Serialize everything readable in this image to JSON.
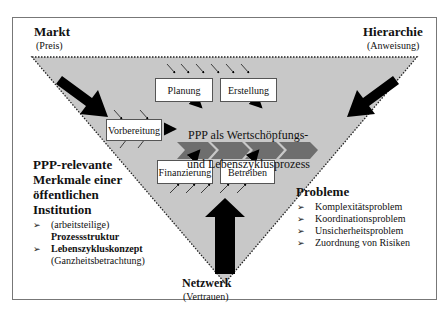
{
  "corners": {
    "markt": {
      "title": "Markt",
      "subtitle": "(Preis)"
    },
    "hierarchie": {
      "title": "Hierarchie",
      "subtitle": "(Anweisung)"
    },
    "netzwerk": {
      "title": "Netzwerk",
      "subtitle": "(Vertrauen)"
    }
  },
  "process_boxes": {
    "planung": "Planung",
    "erstellung": "Erstellung",
    "vorbereitung": "Vorbereitung",
    "finanzierung": "Finanzierung",
    "betreiben": "Betreiben"
  },
  "center_label": {
    "line1": "PPP als Wertschöpfungs-",
    "line2": "und Lebenszyklusprozess"
  },
  "left_panel": {
    "heading_line1": "PPP-relevante",
    "heading_line2": "Merkmale einer",
    "heading_line3": "öffentlichen",
    "heading_line4": "Institution",
    "items": [
      {
        "normal": "(arbeitsteilige)",
        "bold": "Prozessstruktur"
      },
      {
        "bold": "Lebenszykluskonzept",
        "normal": "(Ganzheitsbetrachtung)"
      }
    ]
  },
  "right_panel": {
    "heading": "Probleme",
    "items": [
      "Komplexitätsproblem",
      "Koordinationsproblem",
      "Unsicherheitsproblem",
      "Zuordnung von Risiken"
    ]
  },
  "bullet_glyph": "➢",
  "colors": {
    "triangle_fill": "#c8c8c8",
    "chevron_fill": "#6e6e6e",
    "arrow_fill": "#000000",
    "border": "#777777"
  }
}
